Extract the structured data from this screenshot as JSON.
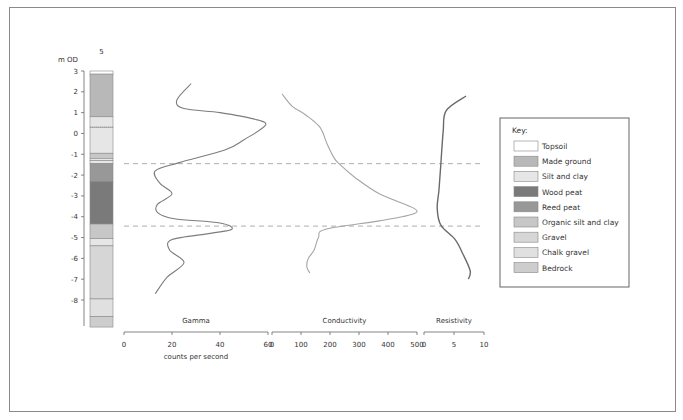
{
  "chart_data": {
    "type": "line",
    "title": "",
    "borehole": {
      "label": "5",
      "y_axis_label": "m OD",
      "y_ticks": [
        3,
        2,
        1,
        0,
        -1,
        -2,
        -3,
        -4,
        -5,
        -6,
        -7,
        -8
      ],
      "ylim": [
        -9.3,
        3
      ],
      "layers": [
        {
          "top": 3.0,
          "base": 2.85,
          "material": "Topsoil"
        },
        {
          "top": 2.85,
          "base": 0.8,
          "material": "Made ground"
        },
        {
          "top": 0.8,
          "base": 0.3,
          "material": "Silt and clay"
        },
        {
          "top": 0.3,
          "base": -0.95,
          "material": "Silt and clay"
        },
        {
          "top": -0.95,
          "base": -1.2,
          "material": "Organic silt and clay"
        },
        {
          "top": -1.2,
          "base": -1.3,
          "material": "Silt and clay"
        },
        {
          "top": -1.3,
          "base": -1.45,
          "material": "Silt and clay"
        },
        {
          "top": -1.45,
          "base": -2.3,
          "material": "Reed peat"
        },
        {
          "top": -2.3,
          "base": -4.35,
          "material": "Wood peat"
        },
        {
          "top": -4.35,
          "base": -5.05,
          "material": "Organic silt and clay"
        },
        {
          "top": -5.05,
          "base": -5.4,
          "material": "Silt and clay"
        },
        {
          "top": -5.4,
          "base": -7.95,
          "material": "Gravel"
        },
        {
          "top": -7.95,
          "base": -8.8,
          "material": "Chalk gravel"
        },
        {
          "top": -8.8,
          "base": -9.3,
          "material": "Bedrock"
        }
      ]
    },
    "boundaries_m_od": [
      -1.45,
      -4.45
    ],
    "series": [
      {
        "name": "Gamma",
        "xlabel": "counts per second",
        "xlim": [
          0,
          60
        ],
        "x_ticks": [
          0,
          20,
          40,
          60
        ],
        "points": [
          [
            28,
            2.4
          ],
          [
            22,
            1.6
          ],
          [
            25,
            1.2
          ],
          [
            40,
            1.0
          ],
          [
            54,
            0.7
          ],
          [
            59,
            0.4
          ],
          [
            50,
            -0.3
          ],
          [
            42,
            -0.8
          ],
          [
            23,
            -1.4
          ],
          [
            13,
            -1.8
          ],
          [
            15,
            -2.4
          ],
          [
            20,
            -2.9
          ],
          [
            14,
            -3.4
          ],
          [
            14,
            -3.8
          ],
          [
            21,
            -4.1
          ],
          [
            40,
            -4.3
          ],
          [
            45,
            -4.6
          ],
          [
            36,
            -4.8
          ],
          [
            20,
            -5.1
          ],
          [
            19,
            -5.6
          ],
          [
            25,
            -6.2
          ],
          [
            18,
            -6.9
          ],
          [
            13,
            -7.7
          ]
        ]
      },
      {
        "name": "Conductivity",
        "xlabel": "",
        "xlim": [
          0,
          500
        ],
        "x_ticks": [
          0,
          100,
          200,
          300,
          400,
          500
        ],
        "points": [
          [
            35,
            1.9
          ],
          [
            70,
            1.3
          ],
          [
            115,
            0.9
          ],
          [
            165,
            0.3
          ],
          [
            190,
            -0.5
          ],
          [
            215,
            -1.2
          ],
          [
            235,
            -1.5
          ],
          [
            285,
            -2.1
          ],
          [
            370,
            -2.9
          ],
          [
            490,
            -3.6
          ],
          [
            480,
            -3.9
          ],
          [
            370,
            -4.2
          ],
          [
            185,
            -4.6
          ],
          [
            160,
            -5.0
          ],
          [
            145,
            -5.6
          ],
          [
            125,
            -6.0
          ],
          [
            120,
            -6.4
          ],
          [
            130,
            -6.7
          ]
        ]
      },
      {
        "name": "Resistivity",
        "xlabel": "",
        "xlim": [
          0,
          10
        ],
        "x_ticks": [
          0,
          5,
          10
        ],
        "points": [
          [
            7,
            1.8
          ],
          [
            3.7,
            1.1
          ],
          [
            3.2,
            0.1
          ],
          [
            2.8,
            -1.5
          ],
          [
            2.5,
            -2.7
          ],
          [
            2.2,
            -3.6
          ],
          [
            2.8,
            -4.4
          ],
          [
            5.2,
            -5.1
          ],
          [
            6.5,
            -5.8
          ],
          [
            7.7,
            -6.6
          ],
          [
            7.4,
            -7.0
          ]
        ]
      }
    ],
    "legend": {
      "title": "Key:",
      "position": "right",
      "entries": [
        {
          "label": "Topsoil",
          "color": "#ffffff"
        },
        {
          "label": "Made ground",
          "color": "#b8b8b8"
        },
        {
          "label": "Silt and clay",
          "color": "#e6e6e6"
        },
        {
          "label": "Wood peat",
          "color": "#7a7a7a"
        },
        {
          "label": "Reed peat",
          "color": "#989898"
        },
        {
          "label": "Organic silt and clay",
          "color": "#c7c7c7"
        },
        {
          "label": "Gravel",
          "color": "#d6d6d6"
        },
        {
          "label": "Chalk gravel",
          "color": "#e0e0e0"
        },
        {
          "label": "Bedrock",
          "color": "#cdcdcd"
        }
      ]
    },
    "grid": false
  },
  "colors": {
    "gamma": "#7d7d7d",
    "conductivity": "#a5a5a5",
    "resistivity": "#6a6a6a",
    "dash": "#9a9a9a",
    "axis": "#666666"
  }
}
